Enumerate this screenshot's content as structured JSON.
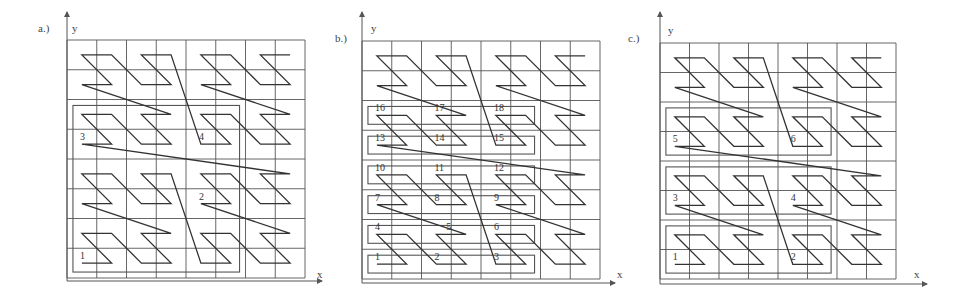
{
  "figure": {
    "panels": [
      {
        "id": "a",
        "label": "a.)",
        "x_axis_label": "x",
        "y_axis_label": "y",
        "grid": {
          "cols": 8,
          "rows": 8
        },
        "curve": "z-order",
        "regions": [
          {
            "col0": 0.2,
            "row0": 0.2,
            "col1": 5.8,
            "row1": 5.8
          }
        ],
        "labels": [
          {
            "text": "1",
            "col": 0.5,
            "row": 0.5
          },
          {
            "text": "2",
            "col": 4.5,
            "row": 2.5
          },
          {
            "text": "3",
            "col": 0.5,
            "row": 4.5
          },
          {
            "text": "4",
            "col": 4.5,
            "row": 4.5
          }
        ]
      },
      {
        "id": "b",
        "label": "b.)",
        "x_axis_label": "x",
        "y_axis_label": "y",
        "grid": {
          "cols": 8,
          "rows": 8
        },
        "curve": "z-order",
        "regions": [
          {
            "col0": 0.2,
            "row0": 0.2,
            "col1": 5.8,
            "row1": 0.8
          },
          {
            "col0": 0.2,
            "row0": 1.2,
            "col1": 5.8,
            "row1": 1.8
          },
          {
            "col0": 0.2,
            "row0": 2.2,
            "col1": 5.8,
            "row1": 2.8
          },
          {
            "col0": 0.2,
            "row0": 3.2,
            "col1": 5.8,
            "row1": 3.8
          },
          {
            "col0": 0.2,
            "row0": 4.2,
            "col1": 5.8,
            "row1": 4.8
          },
          {
            "col0": 0.2,
            "row0": 5.2,
            "col1": 5.8,
            "row1": 5.8
          }
        ],
        "labels": [
          {
            "text": "1",
            "col": 0.5,
            "row": 0.5
          },
          {
            "text": "2",
            "col": 2.5,
            "row": 0.5
          },
          {
            "text": "3",
            "col": 4.5,
            "row": 0.5
          },
          {
            "text": "4",
            "col": 0.5,
            "row": 1.5
          },
          {
            "text": "5",
            "col": 2.9,
            "row": 1.5
          },
          {
            "text": "6",
            "col": 4.5,
            "row": 1.5
          },
          {
            "text": "7",
            "col": 0.5,
            "row": 2.5
          },
          {
            "text": "8",
            "col": 2.5,
            "row": 2.5
          },
          {
            "text": "9",
            "col": 4.5,
            "row": 2.5
          },
          {
            "text": "10",
            "col": 0.5,
            "row": 3.5
          },
          {
            "text": "11",
            "col": 2.5,
            "row": 3.5
          },
          {
            "text": "12",
            "col": 4.5,
            "row": 3.5
          },
          {
            "text": "13",
            "col": 0.5,
            "row": 4.5
          },
          {
            "text": "14",
            "col": 2.5,
            "row": 4.5
          },
          {
            "text": "15",
            "col": 4.5,
            "row": 4.5
          },
          {
            "text": "16",
            "col": 0.5,
            "row": 5.5
          },
          {
            "text": "17",
            "col": 2.5,
            "row": 5.5
          },
          {
            "text": "18",
            "col": 4.5,
            "row": 5.5
          }
        ]
      },
      {
        "id": "c",
        "label": "c.)",
        "x_axis_label": "x",
        "y_axis_label": "y",
        "grid": {
          "cols": 8,
          "rows": 8
        },
        "curve": "z-order",
        "regions": [
          {
            "col0": 0.2,
            "row0": 0.2,
            "col1": 5.8,
            "row1": 1.8
          },
          {
            "col0": 0.2,
            "row0": 2.2,
            "col1": 5.8,
            "row1": 3.8
          },
          {
            "col0": 0.2,
            "row0": 4.2,
            "col1": 5.8,
            "row1": 5.8
          }
        ],
        "labels": [
          {
            "text": "1",
            "col": 0.5,
            "row": 0.5
          },
          {
            "text": "2",
            "col": 4.5,
            "row": 0.5
          },
          {
            "text": "3",
            "col": 0.5,
            "row": 2.5
          },
          {
            "text": "4",
            "col": 4.5,
            "row": 2.5
          },
          {
            "text": "5",
            "col": 0.5,
            "row": 4.5
          },
          {
            "text": "6",
            "col": 4.5,
            "row": 4.5
          }
        ]
      }
    ],
    "colors": {
      "grid": "#555555",
      "curve": "#333333",
      "region": "#555555",
      "text": "#333333"
    }
  }
}
